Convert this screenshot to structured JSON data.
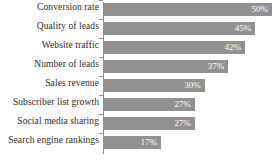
{
  "chart_data": {
    "type": "bar",
    "orientation": "horizontal",
    "title": "",
    "subtitle": "",
    "xlabel": "",
    "ylabel": "",
    "grid": false,
    "legend": false,
    "legend_position": "none",
    "xlim": [
      0,
      50
    ],
    "value_suffix": "%",
    "bar_color": "#919191",
    "value_label_color": "#ffffff",
    "category_label_color": "#2b2b2b",
    "axis_color": "#8e8e8e",
    "background_color": "#ffffff",
    "categories": [
      "Conversion rate",
      "Quality of leads",
      "Website traffic",
      "Number of leads",
      "Sales revenue",
      "Subscriber list growth",
      "Social media sharing",
      "Search engine rankings"
    ],
    "values": [
      50,
      45,
      42,
      37,
      30,
      27,
      27,
      17
    ],
    "value_labels": [
      "50%",
      "45%",
      "42%",
      "37%",
      "30%",
      "27%",
      "27%",
      "17%"
    ]
  }
}
